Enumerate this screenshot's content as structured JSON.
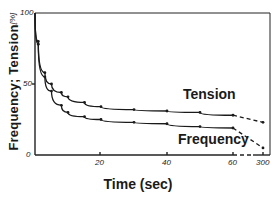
{
  "chart_data": {
    "type": "line",
    "title": "",
    "xlabel": "Time (sec)",
    "ylabel": "Frequency; Tension",
    "yunit": "[%]",
    "ylim": [
      0,
      100
    ],
    "x_ticks": [
      "20",
      "40",
      "60",
      "300"
    ],
    "y_ticks": [
      "0",
      "50",
      "100"
    ],
    "x_axis_break": "between 60 and 300 (dashed)",
    "grid": false,
    "legend": "inline labels",
    "series": [
      {
        "name": "Tension",
        "x": [
          0,
          1,
          3,
          5,
          8,
          10,
          15,
          20,
          30,
          40,
          50,
          60,
          300
        ],
        "values": [
          100,
          80,
          58,
          50,
          44,
          41,
          37,
          34,
          32,
          31,
          30,
          28,
          23
        ]
      },
      {
        "name": "Frequency",
        "x": [
          0,
          1,
          3,
          5,
          8,
          10,
          15,
          20,
          30,
          40,
          50,
          60,
          300
        ],
        "values": [
          100,
          78,
          55,
          45,
          35,
          30,
          27,
          25,
          23,
          22,
          20,
          19,
          5
        ]
      }
    ]
  },
  "labels": {
    "ylabel": "Frequency; Tension",
    "yunit": "[%]",
    "xlabel": "Time (sec)",
    "tension": "Tension",
    "frequency": "Frequency",
    "y0": "0",
    "y50": "50",
    "y100": "100",
    "x20": "20",
    "x40": "40",
    "x60": "60",
    "x300": "300"
  }
}
